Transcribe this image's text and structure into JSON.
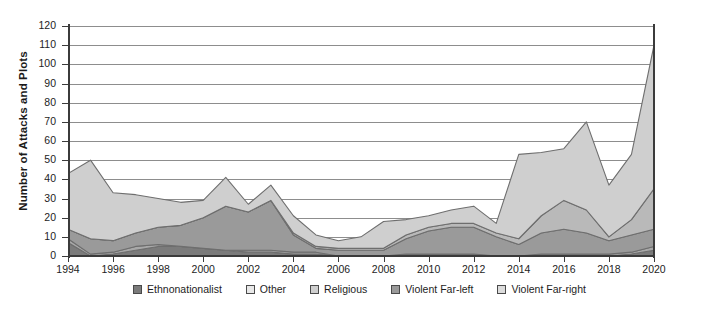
{
  "chart_data": {
    "type": "area",
    "stacked": true,
    "title": "",
    "xlabel": "",
    "ylabel": "Number of Attacks and Plots",
    "xlim": [
      1994,
      2020
    ],
    "ylim": [
      0,
      120
    ],
    "ytick_step": 10,
    "xtick_step": 2,
    "grid": true,
    "legend_position": "bottom",
    "categories": [
      1994,
      1995,
      1996,
      1997,
      1998,
      1999,
      2000,
      2001,
      2002,
      2003,
      2004,
      2005,
      2006,
      2007,
      2008,
      2009,
      2010,
      2011,
      2012,
      2013,
      2014,
      2015,
      2016,
      2017,
      2018,
      2019,
      2020
    ],
    "xtick_labels": [
      "1994",
      "1996",
      "1998",
      "2000",
      "2002",
      "2004",
      "2006",
      "2008",
      "2010",
      "2012",
      "2014",
      "2016",
      "2018",
      "2020"
    ],
    "ytick_labels": [
      "0",
      "10",
      "20",
      "30",
      "40",
      "50",
      "60",
      "70",
      "80",
      "90",
      "100",
      "110",
      "120"
    ],
    "series": [
      {
        "name": "Ethnonationalist",
        "color": "#7b7b7b",
        "values": [
          7,
          0,
          1,
          3,
          5,
          5,
          4,
          3,
          2,
          2,
          1,
          1,
          0,
          0,
          0,
          1,
          1,
          1,
          1,
          0,
          0,
          0,
          0,
          0,
          0,
          1,
          3
        ]
      },
      {
        "name": "Violent Far-left",
        "color": "#a8a8a8",
        "values": [
          2,
          1,
          1,
          2,
          1,
          0,
          0,
          0,
          1,
          1,
          1,
          1,
          0,
          0,
          0,
          0,
          0,
          0,
          0,
          0,
          0,
          1,
          1,
          1,
          1,
          1,
          2
        ]
      },
      {
        "name": "Religious",
        "color": "#9a9a9a",
        "values": [
          5,
          8,
          6,
          7,
          9,
          11,
          16,
          23,
          20,
          26,
          9,
          2,
          3,
          3,
          3,
          8,
          12,
          14,
          14,
          10,
          6,
          11,
          13,
          11,
          7,
          9,
          9
        ]
      },
      {
        "name": "Violent Far-right",
        "color": "#b9b9b9",
        "values": [
          0,
          0,
          0,
          0,
          0,
          0,
          0,
          0,
          0,
          0,
          1,
          1,
          1,
          1,
          1,
          2,
          2,
          2,
          2,
          2,
          3,
          9,
          15,
          12,
          2,
          8,
          21
        ]
      },
      {
        "name": "Other",
        "color": "#cfcfcf",
        "values": [
          29,
          41,
          25,
          20,
          15,
          12,
          9,
          15,
          4,
          8,
          9,
          6,
          4,
          6,
          14,
          8,
          6,
          7,
          9,
          5,
          44,
          33,
          27,
          46,
          27,
          34,
          75
        ]
      }
    ],
    "totals": [
      43,
      50,
      33,
      32,
      30,
      28,
      29,
      41,
      27,
      37,
      21,
      11,
      8,
      10,
      18,
      19,
      21,
      24,
      26,
      17,
      53,
      54,
      56,
      70,
      37,
      53,
      110
    ],
    "legend_labels": [
      "Ethnonationalist",
      "Other",
      "Religious",
      "Violent Far-left",
      "Violent Far-right"
    ],
    "legend_colors": [
      "#7b7b7b",
      "#e8e8e8",
      "#cfcfcf",
      "#9a9a9a",
      "#dcdcdc"
    ]
  }
}
